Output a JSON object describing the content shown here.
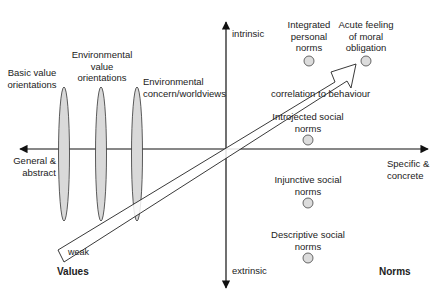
{
  "axes": {
    "vertical": {
      "top_label": "intrinsic",
      "bottom_label": "extrinsic"
    },
    "horizontal": {
      "left_label": "General & abstract",
      "right_label": "Specific & concrete"
    }
  },
  "poles": {
    "left": "Values",
    "right": "Norms"
  },
  "value_constructs": [
    {
      "label": "Basic value orientations",
      "line1": "Basic value",
      "line2": "orientations"
    },
    {
      "label": "Environmental value orientations",
      "line1": "Environmental",
      "line2": "value",
      "line3": "orientations"
    },
    {
      "label": "Environmental concern/worldviews",
      "line1": "Environmental",
      "line2": "concern/worldviews"
    }
  ],
  "norm_constructs": [
    {
      "label": "Integrated personal norms",
      "line1": "Integrated",
      "line2": "personal",
      "line3": "norms"
    },
    {
      "label": "Acute feeling of moral obligation",
      "line1": "Acute feeling",
      "line2": "of moral",
      "line3": "obligation"
    },
    {
      "label": "Introjected social norms",
      "line1": "Introjected social",
      "line2": "norms"
    },
    {
      "label": "Injunctive social norms",
      "line1": "Injunctive social",
      "line2": "norms"
    },
    {
      "label": "Descriptive social norms",
      "line1": "Descriptive social",
      "line2": "norms"
    }
  ],
  "gradient_arrow": {
    "start_label": "weak",
    "label": "correlation to behaviour"
  },
  "colors": {
    "shape_fill": "#d9d9d9",
    "stroke": "#222222",
    "arrow_fill": "#ffffff"
  }
}
